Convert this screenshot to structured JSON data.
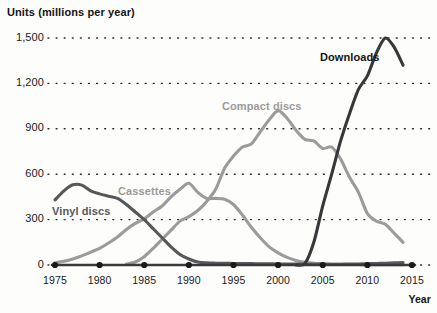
{
  "chart_data": {
    "type": "line",
    "title": "Units (millions per year)",
    "xlabel": "Year",
    "ylabel": "Units (millions per year)",
    "xlim": [
      1975,
      2015
    ],
    "ylim": [
      0,
      1500
    ],
    "grid": "dotted-horizontal",
    "legend": "inline-series-labels",
    "ytick_labels": [
      "0",
      "300",
      "600",
      "900",
      "1,200",
      "1,500"
    ],
    "ytick_values": [
      0,
      300,
      600,
      900,
      1200,
      1500
    ],
    "xtick_labels": [
      "1975",
      "1980",
      "1985",
      "1990",
      "1995",
      "2000",
      "2005",
      "2010",
      "2015"
    ],
    "xtick_values": [
      1975,
      1980,
      1985,
      1990,
      1995,
      2000,
      2005,
      2010,
      2015
    ],
    "series": [
      {
        "name": "Vinyl discs",
        "color": "#58585a",
        "label_x": 52,
        "label_y": 205,
        "x": [
          1975,
          1976,
          1977,
          1978,
          1979,
          1980,
          1981,
          1982,
          1983,
          1984,
          1985,
          1986,
          1987,
          1988,
          1989,
          1990,
          1991,
          1992,
          1993,
          1994,
          1995,
          1996,
          1997,
          1998,
          1999,
          2000,
          2001,
          2002,
          2003,
          2004,
          2005,
          2006,
          2007,
          2008,
          2009,
          2010,
          2011,
          2012,
          2013,
          2014
        ],
        "values": [
          430,
          490,
          530,
          528,
          490,
          470,
          455,
          440,
          400,
          350,
          300,
          240,
          180,
          120,
          70,
          40,
          20,
          14,
          12,
          11,
          10,
          10,
          9,
          8,
          8,
          7,
          6,
          6,
          5,
          5,
          5,
          5,
          5,
          6,
          7,
          8,
          10,
          12,
          14,
          16
        ]
      },
      {
        "name": "Cassettes",
        "color": "#9b9b9b",
        "label_x": 118,
        "label_y": 185,
        "x": [
          1975,
          1976,
          1977,
          1978,
          1979,
          1980,
          1981,
          1982,
          1983,
          1984,
          1985,
          1986,
          1987,
          1988,
          1989,
          1990,
          1991,
          1992,
          1993,
          1994,
          1995,
          1996,
          1997,
          1998,
          1999,
          2000,
          2001,
          2002,
          2003,
          2004,
          2005,
          2006,
          2007,
          2008,
          2009,
          2010,
          2011,
          2012,
          2013,
          2014
        ],
        "values": [
          15,
          25,
          40,
          60,
          85,
          110,
          145,
          185,
          235,
          275,
          305,
          350,
          390,
          450,
          500,
          540,
          480,
          440,
          440,
          435,
          400,
          330,
          250,
          180,
          120,
          80,
          50,
          30,
          18,
          12,
          8,
          5,
          4,
          3,
          3,
          2,
          2,
          2,
          2,
          2
        ]
      },
      {
        "name": "Compact discs",
        "color": "#9b9b9b",
        "label_x": 222,
        "label_y": 100,
        "x": [
          1983,
          1984,
          1985,
          1986,
          1987,
          1988,
          1989,
          1990,
          1991,
          1992,
          1993,
          1994,
          1995,
          1996,
          1997,
          1998,
          1999,
          2000,
          2001,
          2002,
          2003,
          2004,
          2005,
          2006,
          2007,
          2008,
          2009,
          2010,
          2011,
          2012,
          2013,
          2014
        ],
        "values": [
          6,
          20,
          55,
          110,
          170,
          230,
          290,
          320,
          360,
          420,
          500,
          640,
          720,
          780,
          800,
          880,
          960,
          1020,
          970,
          890,
          830,
          820,
          770,
          780,
          700,
          580,
          480,
          340,
          290,
          270,
          210,
          150
        ]
      },
      {
        "name": "Downloads",
        "color": "#38383a",
        "label_x": 320,
        "label_y": 51,
        "x": [
          2002,
          2003,
          2004,
          2005,
          2006,
          2007,
          2008,
          2009,
          2010,
          2011,
          2012,
          2013,
          2014
        ],
        "values": [
          0,
          10,
          150,
          390,
          600,
          820,
          1000,
          1160,
          1250,
          1400,
          1500,
          1440,
          1320
        ]
      }
    ],
    "baseline_markers": {
      "color": "#1a1a1a",
      "years": [
        1975,
        1980,
        1985,
        1990,
        1995,
        2000,
        2005,
        2010,
        2015
      ]
    }
  },
  "colors": {
    "text": "#1a1a1a",
    "grid": "#2a2a2a",
    "background": "#fdfdfb"
  }
}
